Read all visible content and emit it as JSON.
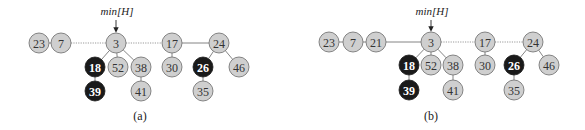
{
  "figure": {
    "panels": [
      {
        "id": "a",
        "caption": "(a)",
        "pointer": {
          "label": "min[H]",
          "x": 116,
          "text_y": 15,
          "arrow_from": 20,
          "arrow_to": 32
        },
        "caption_pos": {
          "x": 140,
          "y": 120
        },
        "nodes": [
          {
            "key": "23",
            "x": 39,
            "y": 43,
            "color": "light"
          },
          {
            "key": "7",
            "x": 61,
            "y": 43,
            "color": "light"
          },
          {
            "key": "3",
            "x": 116,
            "y": 43,
            "color": "light"
          },
          {
            "key": "17",
            "x": 172,
            "y": 43,
            "color": "light"
          },
          {
            "key": "24",
            "x": 219,
            "y": 43,
            "color": "light"
          },
          {
            "key": "18",
            "x": 95,
            "y": 67,
            "color": "dark"
          },
          {
            "key": "52",
            "x": 118,
            "y": 67,
            "color": "light"
          },
          {
            "key": "38",
            "x": 141,
            "y": 67,
            "color": "light"
          },
          {
            "key": "30",
            "x": 172,
            "y": 67,
            "color": "light"
          },
          {
            "key": "26",
            "x": 203,
            "y": 67,
            "color": "dark"
          },
          {
            "key": "46",
            "x": 239,
            "y": 67,
            "color": "light"
          },
          {
            "key": "39",
            "x": 95,
            "y": 91,
            "color": "dark"
          },
          {
            "key": "41",
            "x": 141,
            "y": 91,
            "color": "light"
          },
          {
            "key": "35",
            "x": 203,
            "y": 91,
            "color": "light"
          }
        ],
        "edges": [
          {
            "from": "23",
            "to": "7",
            "style": "solid"
          },
          {
            "from": "7",
            "to": "3",
            "style": "dotted"
          },
          {
            "from": "3",
            "to": "17",
            "style": "dotted"
          },
          {
            "from": "17",
            "to": "24",
            "style": "solid"
          },
          {
            "from": "3",
            "to": "18",
            "style": "solid"
          },
          {
            "from": "3",
            "to": "52",
            "style": "solid"
          },
          {
            "from": "3",
            "to": "38",
            "style": "solid"
          },
          {
            "from": "18",
            "to": "39",
            "style": "solid"
          },
          {
            "from": "38",
            "to": "41",
            "style": "solid"
          },
          {
            "from": "17",
            "to": "30",
            "style": "solid"
          },
          {
            "from": "24",
            "to": "26",
            "style": "solid"
          },
          {
            "from": "24",
            "to": "46",
            "style": "solid"
          },
          {
            "from": "26",
            "to": "35",
            "style": "solid"
          }
        ]
      },
      {
        "id": "b",
        "caption": "(b)",
        "pointer": {
          "label": "min[H]",
          "x": 431,
          "text_y": 15,
          "arrow_from": 20,
          "arrow_to": 31
        },
        "caption_pos": {
          "x": 431,
          "y": 120
        },
        "nodes": [
          {
            "key": "23",
            "x": 329,
            "y": 42,
            "color": "light"
          },
          {
            "key": "7",
            "x": 353,
            "y": 42,
            "color": "light"
          },
          {
            "key": "21",
            "x": 376,
            "y": 42,
            "color": "light"
          },
          {
            "key": "3",
            "x": 431,
            "y": 42,
            "color": "light"
          },
          {
            "key": "17",
            "x": 485,
            "y": 42,
            "color": "light"
          },
          {
            "key": "24",
            "x": 533,
            "y": 42,
            "color": "light"
          },
          {
            "key": "18",
            "x": 409,
            "y": 65,
            "color": "dark"
          },
          {
            "key": "52",
            "x": 431,
            "y": 65,
            "color": "light"
          },
          {
            "key": "38",
            "x": 453,
            "y": 65,
            "color": "light"
          },
          {
            "key": "30",
            "x": 485,
            "y": 65,
            "color": "light"
          },
          {
            "key": "26",
            "x": 514,
            "y": 65,
            "color": "dark"
          },
          {
            "key": "46",
            "x": 549,
            "y": 65,
            "color": "light"
          },
          {
            "key": "39",
            "x": 409,
            "y": 90,
            "color": "dark"
          },
          {
            "key": "41",
            "x": 453,
            "y": 90,
            "color": "light"
          },
          {
            "key": "35",
            "x": 514,
            "y": 90,
            "color": "light"
          }
        ],
        "edges": [
          {
            "from": "23",
            "to": "7",
            "style": "solid"
          },
          {
            "from": "7",
            "to": "21",
            "style": "solid"
          },
          {
            "from": "21",
            "to": "3",
            "style": "solid"
          },
          {
            "from": "3",
            "to": "17",
            "style": "dotted"
          },
          {
            "from": "17",
            "to": "24",
            "style": "dotted"
          },
          {
            "from": "3",
            "to": "18",
            "style": "solid"
          },
          {
            "from": "3",
            "to": "52",
            "style": "solid"
          },
          {
            "from": "3",
            "to": "38",
            "style": "solid"
          },
          {
            "from": "18",
            "to": "39",
            "style": "solid"
          },
          {
            "from": "38",
            "to": "41",
            "style": "solid"
          },
          {
            "from": "17",
            "to": "30",
            "style": "solid"
          },
          {
            "from": "24",
            "to": "26",
            "style": "solid"
          },
          {
            "from": "24",
            "to": "46",
            "style": "solid"
          },
          {
            "from": "26",
            "to": "35",
            "style": "solid"
          }
        ]
      }
    ],
    "node_radius": 10,
    "colors": {
      "light_fill": "#cfcfcf",
      "dark_fill": "#1a1a1a",
      "stroke": "#6a6a6a"
    }
  }
}
